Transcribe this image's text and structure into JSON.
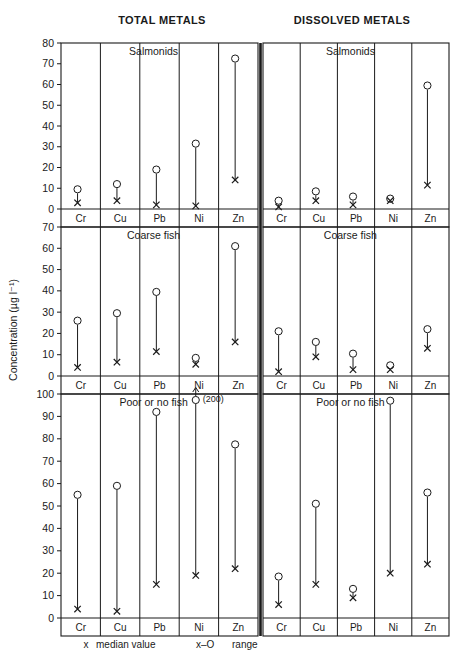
{
  "headers": {
    "left": "TOTAL METALS",
    "right": "DISSOLVED METALS"
  },
  "axis": {
    "ylabel": "Concentration (µg l⁻¹)"
  },
  "legend": {
    "median_symbol": "x",
    "median_text": "median value",
    "range_symbol": "x–O",
    "range_text": "range"
  },
  "annotations": {
    "offscale": "(200)"
  },
  "elements": [
    "Cr",
    "Cu",
    "Pb",
    "Ni",
    "Zn"
  ],
  "chart_data": {
    "type": "scatter",
    "title": "",
    "xlabel": "",
    "ylabel": "Concentration (µg l⁻¹)",
    "grid": false,
    "legend_position": "bottom",
    "categories": [
      "Cr",
      "Cu",
      "Pb",
      "Ni",
      "Zn"
    ],
    "panels": [
      {
        "row": "Salmonids",
        "column": "TOTAL METALS",
        "panel_title": "Salmonids",
        "ylim": [
          0,
          80
        ],
        "yticks": [
          0,
          10,
          20,
          30,
          40,
          50,
          60,
          70,
          80
        ],
        "series": [
          {
            "name": "median value",
            "values": [
              3,
              4,
              2,
              1.5,
              14
            ]
          },
          {
            "name": "range upper",
            "values": [
              9.5,
              12,
              19,
              31.5,
              72.5
            ]
          }
        ]
      },
      {
        "row": "Salmonids",
        "column": "DISSOLVED METALS",
        "panel_title": "Salmonids",
        "ylim": [
          0,
          80
        ],
        "yticks": [
          0,
          10,
          20,
          30,
          40,
          50,
          60,
          70,
          80
        ],
        "series": [
          {
            "name": "median value",
            "values": [
              1,
              4,
              2,
              4,
              11.5
            ]
          },
          {
            "name": "range upper",
            "values": [
              4,
              8.5,
              6,
              5,
              59.5
            ]
          }
        ]
      },
      {
        "row": "Coarse fish",
        "column": "TOTAL METALS",
        "panel_title": "Coarse fish",
        "ylim": [
          0,
          70
        ],
        "yticks": [
          0,
          10,
          20,
          30,
          40,
          50,
          60,
          70
        ],
        "series": [
          {
            "name": "median value",
            "values": [
              4,
              6.5,
              11.5,
              5.5,
              16
            ]
          },
          {
            "name": "range upper",
            "values": [
              26,
              29.5,
              39.5,
              8.5,
              61
            ]
          }
        ]
      },
      {
        "row": "Coarse fish",
        "column": "DISSOLVED METALS",
        "panel_title": "Coarse fish",
        "ylim": [
          0,
          70
        ],
        "yticks": [
          0,
          10,
          20,
          30,
          40,
          50,
          60,
          70
        ],
        "series": [
          {
            "name": "median value",
            "values": [
              2,
              9,
              3,
              3,
              13
            ]
          },
          {
            "name": "range upper",
            "values": [
              21,
              16,
              10.5,
              5,
              22
            ]
          }
        ]
      },
      {
        "row": "Poor or no fish",
        "column": "TOTAL METALS",
        "panel_title": "Poor or no fish",
        "ylim": [
          0,
          100
        ],
        "yticks": [
          0,
          10,
          20,
          30,
          40,
          50,
          60,
          70,
          80,
          90,
          100
        ],
        "series": [
          {
            "name": "median value",
            "values": [
              4,
              3,
              15,
              19,
              22
            ]
          },
          {
            "name": "range upper",
            "values": [
              55,
              59,
              92,
              200,
              77.5
            ]
          }
        ],
        "offscale": {
          "category": "Ni",
          "value": 200,
          "label": "(200)"
        }
      },
      {
        "row": "Poor or no fish",
        "column": "DISSOLVED METALS",
        "panel_title": "Poor or no fish",
        "ylim": [
          0,
          100
        ],
        "yticks": [
          0,
          10,
          20,
          30,
          40,
          50,
          60,
          70,
          80,
          90,
          100
        ],
        "series": [
          {
            "name": "median value",
            "values": [
              6,
              15,
              9,
              20,
              24
            ]
          },
          {
            "name": "range upper",
            "values": [
              18.5,
              51,
              13,
              97,
              56
            ]
          }
        ]
      }
    ]
  }
}
